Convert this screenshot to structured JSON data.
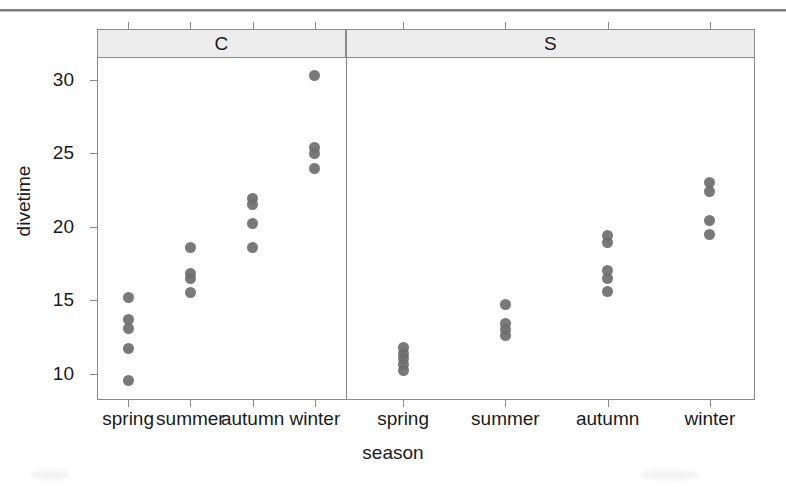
{
  "figure": {
    "type": "dotplot-panel",
    "background": "#ffffff",
    "dot_color": "#6e6e6e",
    "strip_color": "#ededed",
    "frame_color": "#8a8a8a"
  },
  "chart_data": {
    "type": "scatter",
    "title": "",
    "xlabel": "season",
    "ylabel": "divetime",
    "grid": false,
    "legend": null,
    "ylim": [
      8.2,
      31.5
    ],
    "yticks": [
      10,
      15,
      20,
      25,
      30
    ],
    "ytick_labels": [
      "10",
      "15",
      "20",
      "25",
      "30"
    ],
    "categories": [
      "spring",
      "summer",
      "autumn",
      "winter"
    ],
    "panel_variable": "site",
    "panels": [
      {
        "label": "C",
        "groups": [
          {
            "category": "spring",
            "values": [
              15.2,
              13.7,
              13.1,
              11.7,
              9.5
            ]
          },
          {
            "category": "summer",
            "values": [
              18.6,
              16.8,
              16.5,
              15.5
            ]
          },
          {
            "category": "autumn",
            "values": [
              21.9,
              21.5,
              20.2,
              18.6
            ]
          },
          {
            "category": "winter",
            "values": [
              30.3,
              25.4,
              25.0,
              24.0
            ]
          }
        ]
      },
      {
        "label": "S",
        "groups": [
          {
            "category": "spring",
            "values": [
              11.8,
              11.4,
              11.0,
              10.6,
              10.2
            ]
          },
          {
            "category": "summer",
            "values": [
              14.7,
              13.4,
              13.0,
              12.6
            ]
          },
          {
            "category": "autumn",
            "values": [
              19.4,
              18.9,
              17.0,
              16.5,
              15.6
            ]
          },
          {
            "category": "winter",
            "values": [
              23.0,
              22.4,
              20.4,
              19.5
            ]
          }
        ]
      }
    ]
  },
  "axes": {
    "x_title": "season",
    "y_title": "divetime"
  }
}
